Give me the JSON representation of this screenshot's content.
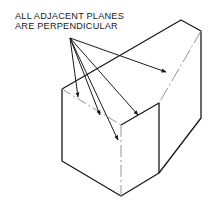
{
  "diagram": {
    "caption_lines": [
      "ALL ADJACENT PLANES",
      "ARE PERPENDICULAR"
    ],
    "arrow_count": 5,
    "line_color": "#1a1a1a",
    "hidden_edge_color": "#8a8a8a"
  }
}
